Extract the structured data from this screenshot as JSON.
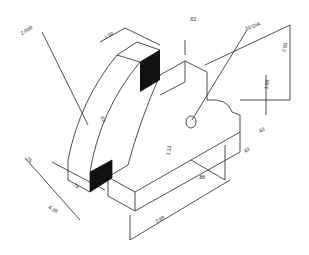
{
  "drawing": {
    "type": "isometric technical drawing",
    "colors": {
      "line": "#222222",
      "fill": "#111111",
      "background": "#ffffff"
    },
    "dimensions": {
      "arc_radius": "2.00R",
      "top_width": "1.50",
      "top_slot": ".63",
      "hole": ".50 DIA",
      "overall_height": "2.50",
      "hole_height": "1.88",
      "right_offset_a": ".63",
      "right_offset_b": ".63",
      "hole_from_edge": ".88",
      "base_height": "1.13",
      "inner_slot": ".63",
      "left_step": ".75",
      "left_depth": ".75",
      "overall_depth": "4.38",
      "overall_length": "3.88"
    }
  }
}
